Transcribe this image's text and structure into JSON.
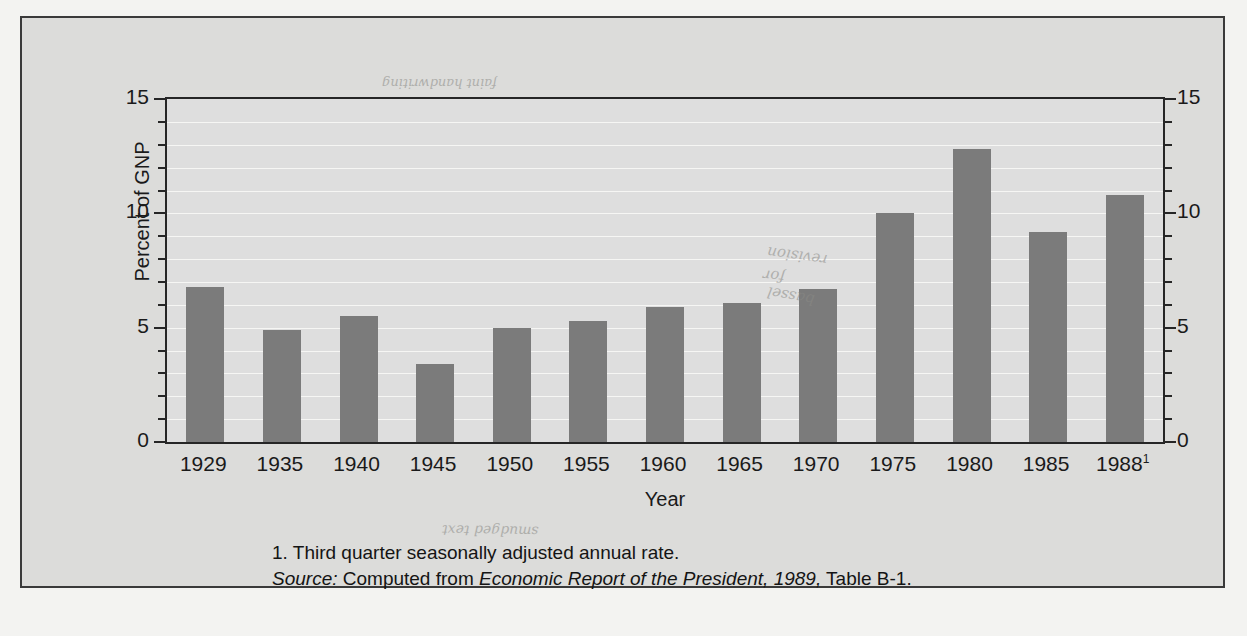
{
  "figure": {
    "axis_title_y": "Percent of GNP",
    "axis_title_x": "Year",
    "footnote": "1.  Third quarter seasonally adjusted annual rate.",
    "source_label": "Source:",
    "source_prefix": " Computed from ",
    "source_title": "Economic Report of the President, 1989,",
    "source_suffix": " Table B-1."
  },
  "colors": {
    "bar": "#7b7b7b",
    "plot_background": "#dedede",
    "frame_background": "#dcdcda",
    "axis": "#262626",
    "gridline": "#f6f6f4",
    "band": "#9b9b99"
  },
  "smudges": {
    "a": "revision",
    "b": "for",
    "c": "bassel",
    "d": "smudged text",
    "top": "faint handwriting"
  },
  "chart_data": {
    "type": "bar",
    "title": "",
    "xlabel": "Year",
    "ylabel": "Percent of GNP",
    "ylim": [
      0,
      15
    ],
    "yticks": [
      0,
      5,
      10,
      15
    ],
    "ytick_labels": [
      "0",
      "5",
      "10",
      "15"
    ],
    "minor_tick_step": 1,
    "grid": true,
    "grid_axis": "y",
    "dual_y_axis": true,
    "legend": "none",
    "categories": [
      "1929",
      "1935",
      "1940",
      "1945",
      "1950",
      "1955",
      "1960",
      "1965",
      "1970",
      "1975",
      "1980",
      "1985",
      "1988"
    ],
    "category_annotations": [
      "",
      "",
      "",
      "",
      "",
      "",
      "",
      "",
      "",
      "",
      "",
      "",
      "1"
    ],
    "values": [
      6.8,
      4.9,
      5.5,
      3.4,
      5.0,
      5.3,
      5.9,
      6.1,
      6.7,
      10.0,
      12.8,
      9.2,
      10.8
    ],
    "series": [
      {
        "name": "Percent of GNP",
        "values": [
          6.8,
          4.9,
          5.5,
          3.4,
          5.0,
          5.3,
          5.9,
          6.1,
          6.7,
          10.0,
          12.8,
          9.2,
          10.8
        ]
      }
    ]
  }
}
